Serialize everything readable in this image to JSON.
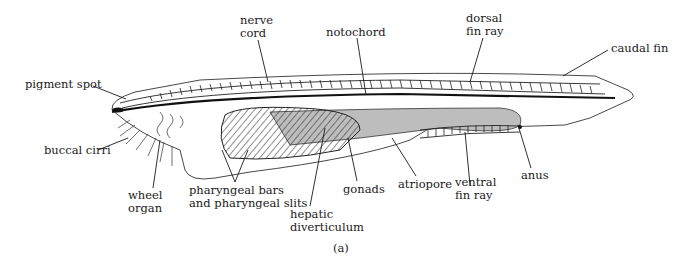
{
  "figure": {
    "caption": "(a)",
    "colors": {
      "line": "#1a1a1a",
      "gut_fill": "#bdbdbd",
      "background": "#ffffff"
    }
  },
  "labels": {
    "nerve_cord": [
      "nerve",
      "cord"
    ],
    "notochord": "notochord",
    "dorsal_fin_ray": [
      "dorsal",
      "fin ray"
    ],
    "caudal_fin": "caudal fin",
    "pigment_spot": "pigment spot",
    "buccal_cirri": "buccal cirri",
    "wheel_organ": [
      "wheel",
      "organ"
    ],
    "pharyngeal_bars": [
      "pharyngeal bars",
      "and pharyngeal slits"
    ],
    "hepatic_diverticulum": [
      "hepatic",
      "diverticulum"
    ],
    "gonads": "gonads",
    "atriopore": "atriopore",
    "ventral_fin_ray": [
      "ventral",
      "fin ray"
    ],
    "anus": "anus"
  }
}
